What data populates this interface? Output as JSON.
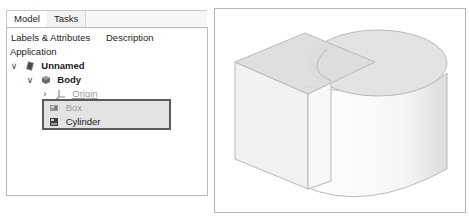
{
  "tabs": [
    {
      "label": "Model",
      "active": true
    },
    {
      "label": "Tasks",
      "active": false
    }
  ],
  "tree": {
    "columns": [
      "Labels & Attributes",
      "Description"
    ],
    "root_label": "Application",
    "items": [
      {
        "label": "Unnamed",
        "icon": "document-icon",
        "expanded": true,
        "bold": true,
        "level": 1
      },
      {
        "label": "Body",
        "icon": "body-icon",
        "expanded": true,
        "bold": true,
        "level": 2
      },
      {
        "label": "Origin",
        "icon": "origin-axes-icon",
        "expanded": false,
        "bold": false,
        "level": 3,
        "greyed": true
      },
      {
        "label": "Box",
        "icon": "box-icon",
        "level": 3,
        "greyed": true,
        "selected": true
      },
      {
        "label": "Cylinder",
        "icon": "cylinder-icon",
        "level": 3,
        "selected": true
      }
    ]
  },
  "viewport": {
    "objects": [
      "Box",
      "Cylinder"
    ],
    "colors": {
      "background": "#ffffff",
      "face_top": "#dedede",
      "face_side": "#f0f0f0",
      "edge": "#b9b9b9",
      "selection_border": "#5b5b5b"
    }
  }
}
